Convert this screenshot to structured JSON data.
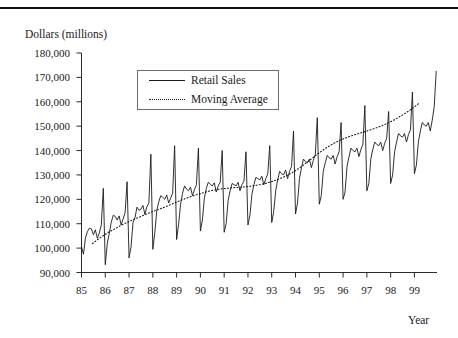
{
  "figure": {
    "y_axis_title": "Dollars (millions)",
    "x_axis_title": "Year"
  },
  "legend": {
    "items": [
      {
        "label": "Retail Sales",
        "style": "solid"
      },
      {
        "label": "Moving Average",
        "style": "dotted"
      }
    ]
  },
  "chart_data": {
    "type": "line",
    "title": "",
    "xlabel": "Year",
    "ylabel": "Dollars (millions)",
    "ylim": [
      90000,
      180000
    ],
    "xlim": [
      1985.0,
      1999.95
    ],
    "ytick_labels": [
      "90,000",
      "100,000",
      "110,000",
      "120,000",
      "130,000",
      "140,000",
      "150,000",
      "160,000",
      "170,000",
      "180,000"
    ],
    "ytick_values": [
      90000,
      100000,
      110000,
      120000,
      130000,
      140000,
      150000,
      160000,
      170000,
      180000
    ],
    "xtick_labels": [
      "85",
      "86",
      "87",
      "88",
      "89",
      "90",
      "91",
      "92",
      "93",
      "94",
      "95",
      "96",
      "97",
      "98",
      "99"
    ],
    "xtick_values": [
      1985,
      1986,
      1987,
      1988,
      1989,
      1990,
      1991,
      1992,
      1993,
      1994,
      1995,
      1996,
      1997,
      1998,
      1999
    ],
    "grid": false,
    "legend_position": "upper-left-inset",
    "series": [
      {
        "name": "Retail Sales",
        "style": "solid",
        "color": "#1a1a1a",
        "x_start": 1985.0,
        "x_step": 0.0833333,
        "values": [
          100500,
          97500,
          104200,
          106800,
          108200,
          107900,
          105500,
          107500,
          104000,
          106200,
          109500,
          124500,
          93200,
          101800,
          106000,
          110500,
          113500,
          113000,
          111500,
          113200,
          109500,
          112000,
          114500,
          127200,
          96000,
          100500,
          110500,
          112500,
          116800,
          115500,
          116000,
          117500,
          113800,
          117000,
          118500,
          138500,
          99500,
          106500,
          115500,
          119000,
          121500,
          120800,
          120000,
          121800,
          118500,
          120500,
          122500,
          142000,
          103500,
          109800,
          118000,
          122500,
          125500,
          124200,
          123500,
          125000,
          121500,
          124000,
          126000,
          141000,
          107000,
          111500,
          120500,
          124500,
          127000,
          126200,
          125500,
          126800,
          123000,
          125500,
          127000,
          140000,
          106500,
          110000,
          119500,
          123500,
          126500,
          126000,
          125500,
          127000,
          123500,
          126000,
          127500,
          139500,
          109500,
          113500,
          122000,
          126000,
          129000,
          128500,
          128000,
          129500,
          126000,
          128500,
          130500,
          142000,
          110500,
          115000,
          123500,
          128000,
          131500,
          130500,
          130000,
          132000,
          128500,
          131500,
          133500,
          148000,
          114000,
          118500,
          128500,
          133000,
          136500,
          135500,
          135000,
          136500,
          133000,
          136000,
          138500,
          153500,
          118000,
          121500,
          131500,
          135000,
          138000,
          137000,
          136500,
          138000,
          134500,
          137500,
          139500,
          151500,
          120000,
          123000,
          133500,
          137500,
          141000,
          140000,
          139500,
          141000,
          137500,
          140500,
          142500,
          158500,
          123500,
          126500,
          136500,
          140500,
          143500,
          142500,
          142000,
          143500,
          140000,
          143000,
          145000,
          156000,
          126500,
          130000,
          139500,
          143500,
          147000,
          146000,
          145500,
          147000,
          143500,
          146500,
          148500,
          164000,
          130500,
          134000,
          143500,
          148000,
          151500,
          150500,
          150000,
          151500,
          148000,
          152500,
          158000,
          172500
        ]
      },
      {
        "name": "Moving Average",
        "style": "dotted",
        "color": "#1a1a1a",
        "x_start": 1985.458,
        "x_step": 0.0833333,
        "values": [
          101858,
          102508,
          103125,
          103708,
          104292,
          104842,
          105358,
          105875,
          106392,
          106883,
          107342,
          107792,
          108233,
          108675,
          109125,
          109558,
          109967,
          110358,
          110742,
          111108,
          111450,
          111792,
          112133,
          112467,
          112800,
          113158,
          113517,
          113858,
          114192,
          114517,
          114833,
          115150,
          115458,
          115758,
          116050,
          116342,
          116650,
          116975,
          117308,
          117650,
          118000,
          118350,
          118700,
          119042,
          119375,
          119700,
          120017,
          120325,
          120625,
          120917,
          121200,
          121475,
          121742,
          122000,
          122250,
          122492,
          122725,
          122950,
          123167,
          123375,
          123567,
          123742,
          123900,
          124042,
          124167,
          124275,
          124375,
          124467,
          124550,
          124625,
          124692,
          124750,
          124800,
          124850,
          124908,
          124975,
          125050,
          125133,
          125225,
          125325,
          125433,
          125550,
          125675,
          125808,
          125950,
          126108,
          126283,
          126475,
          126683,
          126908,
          127150,
          127408,
          127683,
          127975,
          128283,
          128608,
          128950,
          129317,
          129708,
          130125,
          130567,
          131033,
          131525,
          132042,
          132583,
          133150,
          133742,
          134358,
          135000,
          135642,
          136283,
          136925,
          137567,
          138192,
          138800,
          139392,
          139967,
          140525,
          141067,
          141592,
          142100,
          142567,
          143008,
          143425,
          143817,
          144192,
          144550,
          144892,
          145217,
          145525,
          145817,
          146092,
          146350,
          146608,
          146867,
          147125,
          147383,
          147642,
          147900,
          148158,
          148417,
          148683,
          148958,
          149242,
          149533,
          149842,
          150167,
          150508,
          150867,
          151242,
          151633,
          152042,
          152467,
          152908,
          153367,
          153842,
          154333,
          154842,
          155367,
          155908,
          156467,
          157042,
          157633,
          158242,
          158867,
          159508
        ]
      }
    ]
  }
}
